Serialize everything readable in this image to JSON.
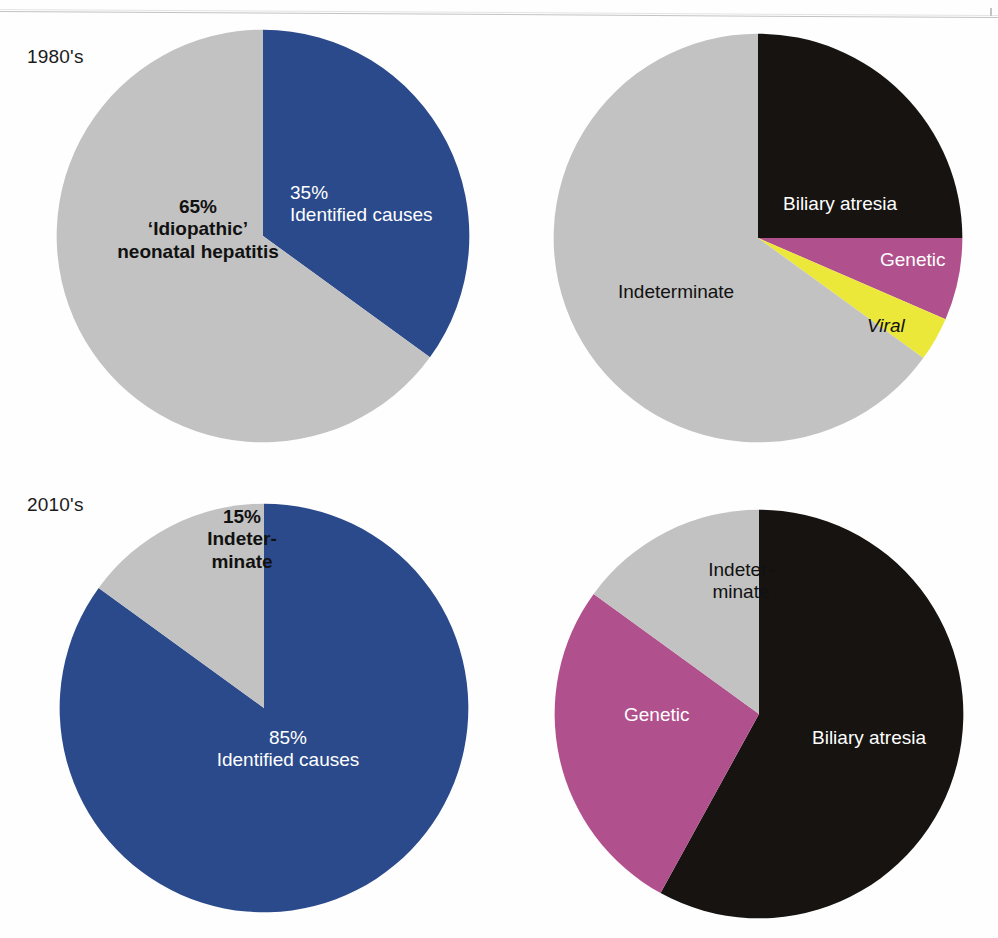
{
  "figure": {
    "background": "#ffffff",
    "decades": [
      {
        "id": "1980s",
        "label": "1980's"
      },
      {
        "id": "2010s",
        "label": "2010's"
      }
    ]
  },
  "palette": {
    "blue": "#2b4a8b",
    "gray": "#c2c2c2",
    "black": "#161310",
    "magenta": "#b0508c",
    "yellow": "#ece83a",
    "white": "#ffffff",
    "text_dark": "#111111"
  },
  "labels": {
    "top_left": {
      "identified_pct": "35%",
      "identified_name": "Identified causes",
      "idiopathic_pct": "65%",
      "idiopathic_line1": "‘Idiopathic’",
      "idiopathic_line2": "neonatal hepatitis"
    },
    "top_right": {
      "biliary": "Biliary atresia",
      "genetic": "Genetic",
      "viral": "Viral",
      "indeterminate": "Indeterminate"
    },
    "bottom_left": {
      "indeterminate_pct": "15%",
      "indeterminate_line1": "Indeter-",
      "indeterminate_line2": "minate",
      "identified_pct": "85%",
      "identified_name": "Identified causes"
    },
    "bottom_right": {
      "indeterminate_line1": "Indeter-",
      "indeterminate_line2": "minate",
      "genetic": "Genetic",
      "biliary": "Biliary atresia"
    }
  },
  "chart_data": [
    {
      "id": "pie-top-left",
      "type": "pie",
      "title": "1980's — overall attribution",
      "start_angle_deg": 0,
      "direction": "clockwise",
      "total": 100,
      "unit": "%",
      "slices": [
        {
          "label": "Identified causes",
          "value": 35,
          "display": "35%",
          "color": "#2b4a8b",
          "text_color": "#ffffff"
        },
        {
          "label": "'Idiopathic' neonatal hepatitis",
          "value": 65,
          "display": "65%",
          "color": "#c2c2c2",
          "text_color": "#111111"
        }
      ]
    },
    {
      "id": "pie-top-right",
      "type": "pie",
      "title": "1980's — diagnostic breakdown",
      "start_angle_deg": 0,
      "direction": "clockwise",
      "total": 100,
      "unit": "%",
      "slices": [
        {
          "label": "Biliary atresia",
          "value": 25,
          "color": "#161310",
          "text_color": "#ffffff"
        },
        {
          "label": "Genetic",
          "value": 6.5,
          "color": "#b0508c",
          "text_color": "#ffffff"
        },
        {
          "label": "Viral",
          "value": 3.5,
          "color": "#ece83a",
          "text_color": "#111111"
        },
        {
          "label": "Indeterminate",
          "value": 65,
          "color": "#c2c2c2",
          "text_color": "#111111"
        }
      ]
    },
    {
      "id": "pie-bottom-left",
      "type": "pie",
      "title": "2010's — overall attribution",
      "start_angle_deg": 0,
      "direction": "clockwise",
      "total": 100,
      "unit": "%",
      "slices": [
        {
          "label": "Identified causes",
          "value": 85,
          "display": "85%",
          "color": "#2b4a8b",
          "text_color": "#ffffff"
        },
        {
          "label": "Indeterminate",
          "value": 15,
          "display": "15%",
          "color": "#c2c2c2",
          "text_color": "#111111"
        }
      ]
    },
    {
      "id": "pie-bottom-right",
      "type": "pie",
      "title": "2010's — diagnostic breakdown",
      "start_angle_deg": 0,
      "direction": "clockwise",
      "total": 100,
      "unit": "%",
      "slices": [
        {
          "label": "Biliary atresia",
          "value": 58,
          "color": "#161310",
          "text_color": "#ffffff"
        },
        {
          "label": "Genetic",
          "value": 27,
          "color": "#b0508c",
          "text_color": "#ffffff"
        },
        {
          "label": "Indeterminate",
          "value": 15,
          "color": "#c2c2c2",
          "text_color": "#111111"
        }
      ]
    }
  ]
}
